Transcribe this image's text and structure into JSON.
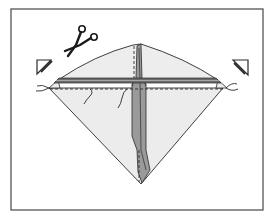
{
  "figure": {
    "colors": {
      "background": "#ffffff",
      "frame": "#555555",
      "outline": "#2a2a2a",
      "paper": "#ececec",
      "spine": "#9a9a9a",
      "spine_dark": "#7a7a7a",
      "spar": "#6a6a6a",
      "marker_fill": "#ffffff"
    },
    "icons": [
      {
        "name": "scissors-icon",
        "meaning": "cut"
      },
      {
        "name": "corner-cut-marker-left-icon",
        "meaning": "trim corner"
      },
      {
        "name": "corner-cut-marker-right-icon",
        "meaning": "trim corner"
      }
    ],
    "elements": {
      "frame": "Rectangular border",
      "kite_body": "Diamond sail",
      "spine": "Vertical centre stick",
      "spar": "Horizontal cross stick",
      "fold_lines": "Dashed guide lines",
      "tie_strings": "String ties at left and right corners"
    }
  }
}
